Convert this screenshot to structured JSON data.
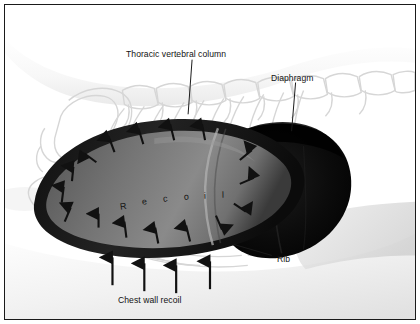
{
  "figure": {
    "border_color": "#1a1a1a",
    "background_color": "#ffffff"
  },
  "labels": {
    "thoracic_vertebral_column": "Thoracic vertebral column",
    "diaphragm": "Diaphragm",
    "rib": "Rib",
    "chest_wall_recoil": "Chest wall recoil"
  },
  "lung_text": {
    "word": "Recoil",
    "letters": [
      "R",
      "e",
      "c",
      "o",
      "i",
      "l"
    ]
  },
  "colors": {
    "lung_interior": "#6e6e6e",
    "lung_rim": "#171717",
    "diaphragm": "#070707",
    "skeleton_outline": "#d8d8d8",
    "arrow": "#111111",
    "label_text": "#121212",
    "soft_tissue": "#f2f2f2"
  },
  "arrows": {
    "recoil_inward_count": 16,
    "chest_wall_down_count": 4
  }
}
